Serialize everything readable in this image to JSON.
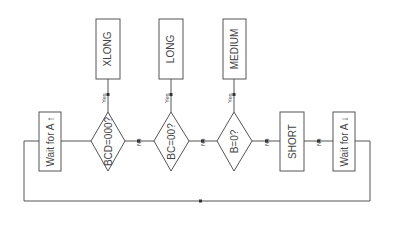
{
  "nodes": {
    "wait_up": "Wait for A ↑",
    "bcd": "BCD=000?",
    "bc": "BC=00?",
    "b": "B=0?",
    "short": "SHORT",
    "wait_down": "Wait for A ↓",
    "xlong": "XLONG",
    "long": "LONG",
    "medium": "MEDIUM"
  },
  "edges": {
    "yes": "Yes",
    "no": "No"
  }
}
